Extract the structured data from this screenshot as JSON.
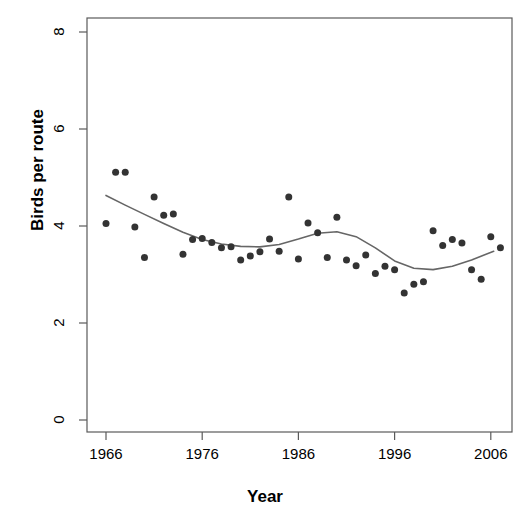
{
  "chart_data": {
    "type": "scatter",
    "title": "",
    "xlabel": "Year",
    "ylabel": "Birds per route",
    "xlim": [
      1964.3,
      2008.0
    ],
    "ylim": [
      0,
      8.4
    ],
    "xticks": [
      1966,
      1976,
      1986,
      1996,
      2006
    ],
    "xtick_labels": [
      "1966",
      "1976",
      "1986",
      "1996",
      "2006"
    ],
    "yticks": [
      0,
      2,
      4,
      6,
      8
    ],
    "ytick_labels": [
      "0",
      "2",
      "4",
      "6",
      "8"
    ],
    "grid": false,
    "legend": false,
    "point_color": "#333333",
    "point_size": 7,
    "line_color": "#666666",
    "line_width": 1.6,
    "series": [
      {
        "name": "Birds per route",
        "marker": "filled-circle",
        "x": [
          1966,
          1967,
          1968,
          1969,
          1970,
          1971,
          1972,
          1973,
          1974,
          1975,
          1976,
          1977,
          1978,
          1979,
          1980,
          1981,
          1982,
          1983,
          1984,
          1985,
          1986,
          1987,
          1988,
          1989,
          1990,
          1991,
          1992,
          1993,
          1994,
          1995,
          1996,
          1997,
          1998,
          1999,
          2000,
          2001,
          2002,
          2003,
          2004,
          2005,
          2006,
          2007
        ],
        "y": [
          4.05,
          5.11,
          5.11,
          3.98,
          3.35,
          4.6,
          4.22,
          4.25,
          3.42,
          3.72,
          3.74,
          3.66,
          3.55,
          3.57,
          3.3,
          3.38,
          3.47,
          3.73,
          3.48,
          4.6,
          3.32,
          4.06,
          3.86,
          3.35,
          4.18,
          3.3,
          3.18,
          3.4,
          3.02,
          3.17,
          3.1,
          2.62,
          2.8,
          2.85,
          3.9,
          3.6,
          3.72,
          3.65,
          3.1,
          2.9,
          3.78,
          3.55
        ]
      }
    ],
    "smoother": {
      "name": "loess trend",
      "x": [
        1966.0,
        1968.0,
        1970.0,
        1972.0,
        1974.0,
        1976.0,
        1978.0,
        1980.0,
        1982.0,
        1984.0,
        1986.0,
        1988.0,
        1990.0,
        1992.0,
        1994.0,
        1996.0,
        1998.0,
        2000.0,
        2002.0,
        2004.0,
        2006.3
      ],
      "y": [
        4.63,
        4.43,
        4.24,
        4.05,
        3.87,
        3.72,
        3.63,
        3.58,
        3.57,
        3.62,
        3.73,
        3.85,
        3.88,
        3.78,
        3.55,
        3.28,
        3.13,
        3.1,
        3.17,
        3.3,
        3.48
      ]
    }
  }
}
